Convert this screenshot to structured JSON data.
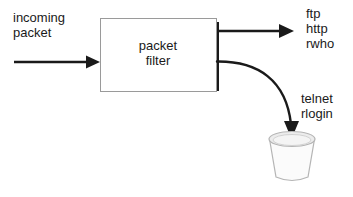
{
  "diagram": {
    "background_color": "#ffffff",
    "stroke_color": "#1a1a1a",
    "basket_fill_color": "#f7f7f7",
    "basket_lid_fill_color": "#e8e8e8",
    "basket_stroke_color": "#b5b5b5",
    "nodes": {
      "incoming_label": {
        "text": "incoming\npacket",
        "role": "input-annotation"
      },
      "filter_box": {
        "label": "packet\nfilter",
        "shape": "rectangle-with-shadow"
      },
      "allowed_label": {
        "text": "ftp\nhttp\nrwho",
        "role": "allowed-services-annotation"
      },
      "blocked_label": {
        "text": "telnet\nrlogin",
        "role": "blocked-services-annotation"
      },
      "wastebasket": {
        "name": "wastebasket",
        "role": "discard-target"
      }
    },
    "edges": {
      "inbound_arrow": {
        "name": "incoming-packet-arrow",
        "direction": "right",
        "style": "straight"
      },
      "allowed_arrow": {
        "name": "allowed-traffic-arrow",
        "direction": "right",
        "style": "straight"
      },
      "blocked_arrow": {
        "name": "blocked-traffic-arrow",
        "direction": "down",
        "style": "curved"
      }
    }
  }
}
